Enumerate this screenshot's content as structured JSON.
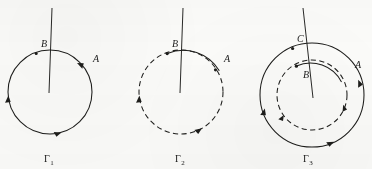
{
  "figure": {
    "type": "diagram",
    "background_color": "#fbfbf9",
    "ink_color": "#1d1d1b"
  },
  "panels": [
    {
      "id": "panel-1",
      "caption": "Γ",
      "caption_subscript": "1",
      "center": {
        "x": 50,
        "y": 92
      },
      "radius": 42,
      "circle_style": "solid",
      "orientation": "counterclockwise",
      "line": {
        "x1": 52,
        "y1": 8,
        "x2": 49,
        "y2": 93
      },
      "points": [
        {
          "label": "B",
          "x": 36,
          "y": 53,
          "marker": false,
          "label_x": 41,
          "label_y": 47
        },
        {
          "label": "A",
          "x": 84,
          "y": 66,
          "marker": false,
          "label_x": 93,
          "label_y": 62
        }
      ],
      "arrows": [
        {
          "at_angle": 60,
          "direction": "ccw"
        },
        {
          "at_angle": 185,
          "direction": "ccw"
        },
        {
          "at_angle": 285,
          "direction": "ccw"
        }
      ]
    },
    {
      "id": "panel-2",
      "caption": "Γ",
      "caption_subscript": "2",
      "center": {
        "x": 181,
        "y": 92
      },
      "radius": 42,
      "circle_style": "dashed",
      "orientation": "counterclockwise",
      "line": {
        "x1": 183,
        "y1": 8,
        "x2": 180,
        "y2": 93
      },
      "points": [
        {
          "label": "B",
          "x": 167,
          "y": 53,
          "marker": true,
          "label_x": 172,
          "label_y": 47
        },
        {
          "label": "A",
          "x": 215,
          "y": 66,
          "marker": true,
          "label_x": 224,
          "label_y": 62
        }
      ],
      "arrows": [
        {
          "at_angle": 185,
          "direction": "ccw"
        },
        {
          "at_angle": 300,
          "direction": "ccw"
        }
      ],
      "solid_arc": {
        "from_angle": 25,
        "to_angle": 110
      }
    },
    {
      "id": "panel-3",
      "caption": "Γ",
      "caption_subscript": "3",
      "center": {
        "x": 312,
        "y": 95
      },
      "outer_radius": 52,
      "inner_radius": 35,
      "outer_style": "solid",
      "inner_style": "dashed",
      "orientation": "counterclockwise",
      "line": {
        "x1": 303,
        "y1": 8,
        "x2": 313,
        "y2": 98
      },
      "points": [
        {
          "label": "C",
          "x": 292,
          "y": 48,
          "marker": true,
          "label_x": 297,
          "label_y": 42
        },
        {
          "label": "B",
          "x": 296,
          "y": 66,
          "marker": true,
          "label_x": 303,
          "label_y": 77
        },
        {
          "label": "A",
          "x": 350,
          "y": 71,
          "marker": false,
          "label_x": 355,
          "label_y": 68
        }
      ],
      "arrows": [
        {
          "at_angle": 190,
          "direction": "ccw",
          "ring": "outer"
        },
        {
          "at_angle": 295,
          "direction": "ccw",
          "ring": "outer"
        },
        {
          "at_angle": 20,
          "direction": "ccw",
          "ring": "outer"
        },
        {
          "at_angle": 200,
          "direction": "ccw",
          "ring": "inner"
        },
        {
          "at_angle": 30,
          "direction": "ccw",
          "ring": "inner"
        }
      ]
    }
  ]
}
